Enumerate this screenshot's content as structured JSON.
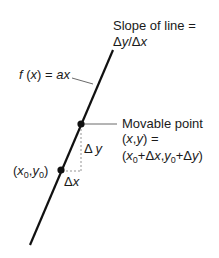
{
  "diagram": {
    "labels": {
      "slope_line1": "Slope of line =",
      "slope_line2": "Δy/Δx",
      "function": "f (x) = ax",
      "movable_point_title": "Movable point",
      "movable_point_xy": "(x,y) =",
      "movable_point_expr": "(x0+Δx,y0+Δy)",
      "initial_point": "(x0,y0)",
      "delta_x": "Δx",
      "delta_y": "Δy"
    },
    "colors": {
      "line": "#111111",
      "dashed": "#888888",
      "text": "#1a1a1a"
    },
    "geometry": {
      "line": {
        "x1": 113,
        "y1": 50,
        "x2": 30,
        "y2": 245
      },
      "initial_point": {
        "x": 61,
        "y": 170
      },
      "movable_point": {
        "x": 81,
        "y": 124
      }
    }
  }
}
